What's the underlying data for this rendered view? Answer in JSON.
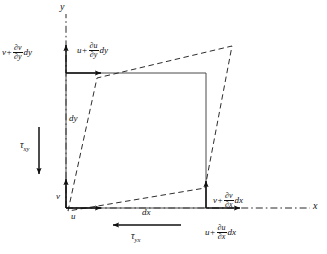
{
  "figure": {
    "type": "engineering-diagram",
    "colors": {
      "ink": "#111111",
      "background": "#ffffff",
      "undeformed_outline": "#555555",
      "deformed_outline": "#222222"
    },
    "axes": {
      "y_label": "y",
      "x_label": "x",
      "origin_label": "O"
    },
    "labels": {
      "v_plus_dvdy_dy": {
        "lead": "v",
        "plus": "+",
        "numerator": "∂v",
        "denominator": "∂y",
        "trail": "dy"
      },
      "u_plus_dudy_dy": {
        "lead": "u",
        "plus": "+",
        "numerator": "∂u",
        "denominator": "∂y",
        "trail": "dy"
      },
      "v_plus_dvdx_dx": {
        "lead": "v",
        "plus": "+",
        "numerator": "∂v",
        "denominator": "∂x",
        "trail": "dx"
      },
      "u_plus_dudx_dx": {
        "lead": "u",
        "plus": "+",
        "numerator": "∂u",
        "denominator": "∂x",
        "trail": "dx"
      },
      "tau_xy": {
        "symbol": "τ",
        "subscript": "xy"
      },
      "tau_yx": {
        "symbol": "τ",
        "subscript": "yx"
      },
      "dy": "dy",
      "dx": "dx",
      "u": "u",
      "v": "v"
    },
    "geometry": {
      "origin": {
        "x": 66,
        "y": 208
      },
      "undeformed_square": {
        "top_left": {
          "x": 66,
          "y": 73
        },
        "top_right": {
          "x": 206,
          "y": 73
        },
        "bottom_right": {
          "x": 206,
          "y": 208
        },
        "bottom_left": {
          "x": 66,
          "y": 208
        },
        "side_x_label": "dx",
        "side_y_label": "dy"
      },
      "deformed_quad": {
        "top_left": {
          "x": 97,
          "y": 78
        },
        "top_right": {
          "x": 232,
          "y": 46
        },
        "bottom_right": {
          "x": 205,
          "y": 188
        },
        "bottom_left": {
          "x": 68,
          "y": 211
        }
      },
      "arrows": [
        {
          "name": "arrow-u-origin",
          "direction": "right",
          "from": {
            "x": 66,
            "y": 208
          },
          "to": {
            "x": 104,
            "y": 208
          }
        },
        {
          "name": "arrow-v-origin",
          "direction": "up",
          "from": {
            "x": 66,
            "y": 208
          },
          "to": {
            "x": 66,
            "y": 176
          }
        },
        {
          "name": "arrow-u-top-left",
          "direction": "right",
          "from": {
            "x": 66,
            "y": 73
          },
          "to": {
            "x": 104,
            "y": 73
          }
        },
        {
          "name": "arrow-v-top-left",
          "direction": "up",
          "from": {
            "x": 66,
            "y": 73
          },
          "to": {
            "x": 66,
            "y": 42
          }
        },
        {
          "name": "arrow-u-bottom-right",
          "direction": "right",
          "from": {
            "x": 206,
            "y": 208
          },
          "to": {
            "x": 243,
            "y": 208
          }
        },
        {
          "name": "arrow-v-bottom-right",
          "direction": "up",
          "from": {
            "x": 206,
            "y": 208
          },
          "to": {
            "x": 206,
            "y": 178
          }
        },
        {
          "name": "arrow-tau-xy",
          "direction": "down",
          "from": {
            "x": 39,
            "y": 127
          },
          "to": {
            "x": 39,
            "y": 177
          }
        },
        {
          "name": "arrow-tau-yx",
          "direction": "left",
          "from": {
            "x": 180,
            "y": 225
          },
          "to": {
            "x": 110,
            "y": 225
          }
        }
      ]
    }
  }
}
